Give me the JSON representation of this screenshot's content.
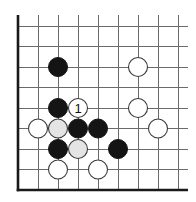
{
  "diagram": {
    "type": "go-board-fragment",
    "board": {
      "columns": 9,
      "rows": 9,
      "origin_x": 18,
      "origin_y": 26,
      "spacing_x": 20,
      "spacing_y": 20.5,
      "line_extend_top": 11,
      "line_extend_right": 10,
      "edges": [
        "left",
        "bottom"
      ],
      "colors": {
        "grid": "#6a6a6a",
        "edge": "#1a1a1a",
        "black_stone": "#141414",
        "white_stone": "#ffffff",
        "marked_white_stone": "#e4e4e4"
      }
    },
    "stones": [
      {
        "color": "black",
        "col": 2,
        "row": 2
      },
      {
        "color": "white",
        "col": 6,
        "row": 2
      },
      {
        "color": "black",
        "col": 2,
        "row": 4
      },
      {
        "color": "white",
        "col": 3,
        "row": 4,
        "label": "1"
      },
      {
        "color": "white",
        "col": 6,
        "row": 4
      },
      {
        "color": "white",
        "col": 1,
        "row": 5
      },
      {
        "color": "gray",
        "col": 2,
        "row": 5
      },
      {
        "color": "black",
        "col": 3,
        "row": 5
      },
      {
        "color": "black",
        "col": 4,
        "row": 5
      },
      {
        "color": "white",
        "col": 7,
        "row": 5
      },
      {
        "color": "black",
        "col": 2,
        "row": 6
      },
      {
        "color": "gray",
        "col": 3,
        "row": 6
      },
      {
        "color": "black",
        "col": 5,
        "row": 6
      },
      {
        "color": "white",
        "col": 2,
        "row": 7
      },
      {
        "color": "white",
        "col": 4,
        "row": 7
      }
    ],
    "stone_radius": 9.5,
    "move_labels": [
      {
        "text": "1",
        "col": 3,
        "row": 4
      }
    ]
  }
}
